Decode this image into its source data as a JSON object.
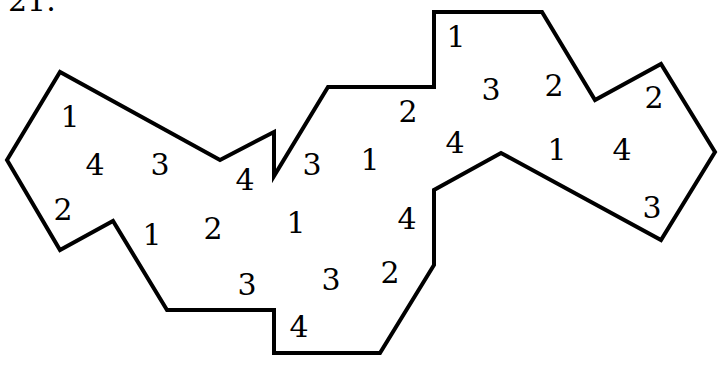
{
  "problem": {
    "number": "21."
  },
  "figure": {
    "stroke_color": "#000000",
    "stroke_width": 4,
    "fill": "#ffffff",
    "polygon_points": "7,160 60,72 220,160 274,132 274,176 328,87 434,87 434,12 542,12 595,100 661,64 715,152 661,240 501,153 434,190 434,265 380,353 274,353 274,310 167,310 113,221 60,250",
    "numbers": [
      {
        "value": "1",
        "x": 70,
        "y": 117
      },
      {
        "value": "4",
        "x": 95,
        "y": 165
      },
      {
        "value": "3",
        "x": 160,
        "y": 165
      },
      {
        "value": "4",
        "x": 245,
        "y": 180
      },
      {
        "value": "2",
        "x": 63,
        "y": 210
      },
      {
        "value": "1",
        "x": 152,
        "y": 235
      },
      {
        "value": "2",
        "x": 213,
        "y": 229
      },
      {
        "value": "1",
        "x": 296,
        "y": 223
      },
      {
        "value": "3",
        "x": 247,
        "y": 285
      },
      {
        "value": "3",
        "x": 312,
        "y": 165
      },
      {
        "value": "1",
        "x": 370,
        "y": 160
      },
      {
        "value": "2",
        "x": 408,
        "y": 112
      },
      {
        "value": "4",
        "x": 455,
        "y": 143
      },
      {
        "value": "4",
        "x": 407,
        "y": 219
      },
      {
        "value": "3",
        "x": 331,
        "y": 280
      },
      {
        "value": "2",
        "x": 390,
        "y": 273
      },
      {
        "value": "4",
        "x": 299,
        "y": 327
      },
      {
        "value": "1",
        "x": 456,
        "y": 37
      },
      {
        "value": "3",
        "x": 491,
        "y": 90
      },
      {
        "value": "2",
        "x": 554,
        "y": 86
      },
      {
        "value": "1",
        "x": 557,
        "y": 150
      },
      {
        "value": "4",
        "x": 622,
        "y": 150
      },
      {
        "value": "2",
        "x": 654,
        "y": 98
      },
      {
        "value": "3",
        "x": 652,
        "y": 208
      }
    ]
  }
}
